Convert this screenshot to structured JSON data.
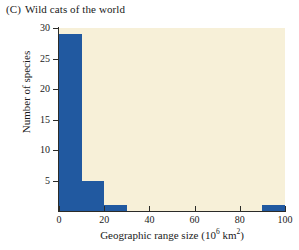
{
  "figure": {
    "panel_letter": "(C)",
    "title": "Wild cats of the world"
  },
  "chart_data": {
    "type": "bar",
    "title": "Wild cats of the world",
    "panel": "(C)",
    "xlabel": "Geographic range size (10⁶ km²)",
    "xlabel_text": "Geographic range size (",
    "xlabel_base": "10",
    "xlabel_exp": "6",
    "xlabel_unit": " km",
    "xlabel_unit_exp": "2",
    "xlabel_close": ")",
    "ylabel": "Number of species",
    "xlim": [
      0,
      100
    ],
    "ylim": [
      0,
      30
    ],
    "bin_width": 10,
    "grid": false,
    "legend": null,
    "bar_color": "#2159a0",
    "plot_background": "#f7f0d8",
    "page_background": "#ffffff",
    "axis_color": "#2b2b28",
    "categories": [
      "0-10",
      "10-20",
      "20-30",
      "30-40",
      "40-50",
      "50-60",
      "60-70",
      "70-80",
      "80-90",
      "90-100"
    ],
    "bin_edges": [
      0,
      10,
      20,
      30,
      40,
      50,
      60,
      70,
      80,
      90,
      100
    ],
    "values": [
      29,
      5,
      1,
      0,
      0,
      0,
      0,
      0,
      0,
      1
    ],
    "xticks": [
      0,
      20,
      40,
      60,
      80,
      100
    ],
    "xtick_labels": [
      "0",
      "20",
      "40",
      "60",
      "80",
      "100"
    ],
    "yticks": [
      5,
      10,
      15,
      20,
      25,
      30
    ],
    "ytick_labels": [
      "5",
      "10",
      "15",
      "20",
      "25",
      "30"
    ]
  }
}
